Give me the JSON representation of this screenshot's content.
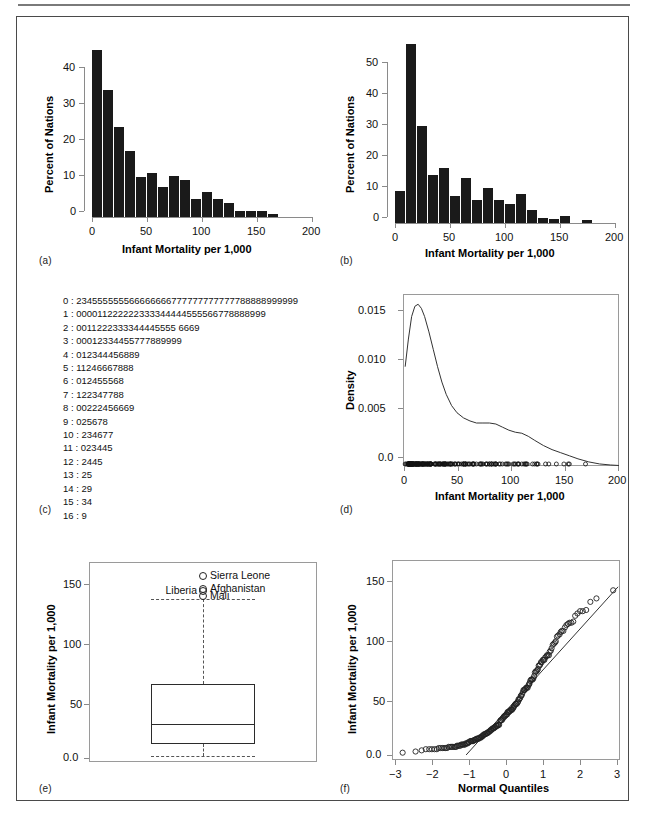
{
  "figure": {
    "panel_tags": [
      "(a)",
      "(b)",
      "(c)",
      "(d)",
      "(e)",
      "(f)"
    ]
  },
  "chart_data": [
    {
      "id": "panel-a",
      "type": "bar",
      "title": "",
      "xlabel": "Infant Mortality per 1,000",
      "ylabel": "Percent of Nations",
      "xlim": [
        0,
        200
      ],
      "ylim": [
        0,
        46
      ],
      "xticks": [
        0,
        50,
        100,
        150,
        200
      ],
      "yticks": [
        0,
        10,
        20,
        30,
        40
      ],
      "grid": false,
      "bin_width": 10,
      "bin_starts": [
        0,
        10,
        20,
        30,
        40,
        50,
        60,
        70,
        80,
        90,
        100,
        110,
        120,
        130,
        140,
        150,
        160
      ],
      "values": [
        44.6,
        33.8,
        23.9,
        17.6,
        10.7,
        11.7,
        7.9,
        10.9,
        9.8,
        4.9,
        6.8,
        4.8,
        3.7,
        1.5,
        1.5,
        1.5,
        0.7
      ]
    },
    {
      "id": "panel-b",
      "type": "bar",
      "title": "",
      "xlabel": "Infant Mortality per 1,000",
      "ylabel": "Percent of Nations",
      "xlim": [
        0,
        200
      ],
      "ylim": [
        0,
        57
      ],
      "xticks": [
        0,
        50,
        100,
        150,
        200
      ],
      "yticks": [
        0,
        10,
        20,
        30,
        40,
        50
      ],
      "grid": false,
      "bin_width": 10,
      "bin_starts": [
        0,
        10,
        20,
        30,
        40,
        50,
        60,
        70,
        80,
        90,
        100,
        110,
        120,
        130,
        140,
        150,
        160,
        170
      ],
      "values": [
        10,
        55.5,
        30,
        15,
        17,
        8.3,
        14,
        7,
        11,
        7,
        6,
        9,
        4,
        1.7,
        1.1,
        2.1,
        0,
        1
      ]
    },
    {
      "id": "panel-c",
      "type": "table",
      "title": "Stem-and-leaf display",
      "stem_separator": " : ",
      "rows": [
        {
          "stem": "0",
          "leaves": "234555555566666666777777777777788888999999"
        },
        {
          "stem": "1",
          "leaves": "000011222222333344444555566778888999"
        },
        {
          "stem": "2",
          "leaves": "0011222333344445555 6669"
        },
        {
          "stem": "3",
          "leaves": "00012334455777889999"
        },
        {
          "stem": "4",
          "leaves": "012344456889"
        },
        {
          "stem": "5",
          "leaves": "11246667888"
        },
        {
          "stem": "6",
          "leaves": "012455568"
        },
        {
          "stem": "7",
          "leaves": "122347788"
        },
        {
          "stem": "8",
          "leaves": "00222456669"
        },
        {
          "stem": "9",
          "leaves": "025678"
        },
        {
          "stem": "10",
          "leaves": "234677"
        },
        {
          "stem": "11",
          "leaves": "023445"
        },
        {
          "stem": "12",
          "leaves": "2445"
        },
        {
          "stem": "13",
          "leaves": "25"
        },
        {
          "stem": "14",
          "leaves": "29"
        },
        {
          "stem": "15",
          "leaves": "34"
        },
        {
          "stem": "16",
          "leaves": "9"
        }
      ]
    },
    {
      "id": "panel-d",
      "type": "line",
      "title": "",
      "xlabel": "Infant Mortality per 1,000",
      "ylabel": "Density",
      "xlim": [
        0,
        200
      ],
      "ylim": [
        0,
        0.0168
      ],
      "xticks": [
        0,
        50,
        100,
        150,
        200
      ],
      "yticks": [
        0.0,
        0.005,
        0.01,
        0.015
      ],
      "ytick_labels": [
        "0.0",
        "0.005",
        "0.010",
        "0.015"
      ],
      "grid": false,
      "series": [
        {
          "name": "kernel density",
          "x": [
            2,
            5,
            8,
            11,
            14,
            17,
            20,
            24,
            28,
            32,
            36,
            40,
            45,
            50,
            56,
            62,
            68,
            74,
            80,
            86,
            92,
            98,
            104,
            110,
            116,
            122,
            130,
            138,
            146,
            154,
            162,
            172,
            182,
            192,
            200
          ],
          "y": [
            0.0097,
            0.0124,
            0.0146,
            0.0156,
            0.0158,
            0.0154,
            0.0146,
            0.0131,
            0.0114,
            0.0097,
            0.0082,
            0.007,
            0.0059,
            0.0052,
            0.0047,
            0.0044,
            0.0042,
            0.0042,
            0.0042,
            0.0041,
            0.0038,
            0.0035,
            0.0033,
            0.0032,
            0.0029,
            0.0025,
            0.002,
            0.0016,
            0.0013,
            0.001,
            0.0007,
            0.0004,
            0.0002,
            0.0001,
            5e-05
          ]
        }
      ],
      "rug": {
        "description": "open-circle rug of observations along y=0",
        "values": [
          2,
          3,
          4,
          5,
          5,
          5,
          5,
          5,
          5,
          5,
          5,
          6,
          6,
          6,
          6,
          6,
          6,
          6,
          6,
          7,
          7,
          7,
          7,
          7,
          7,
          7,
          7,
          7,
          7,
          7,
          8,
          8,
          8,
          8,
          8,
          9,
          9,
          9,
          9,
          9,
          9,
          10,
          10,
          10,
          10,
          11,
          11,
          12,
          12,
          12,
          12,
          12,
          12,
          13,
          13,
          13,
          13,
          14,
          14,
          14,
          14,
          14,
          15,
          15,
          15,
          15,
          16,
          16,
          17,
          17,
          18,
          18,
          18,
          18,
          19,
          19,
          19,
          20,
          20,
          21,
          21,
          22,
          22,
          23,
          23,
          23,
          24,
          24,
          25,
          25,
          25,
          25,
          26,
          26,
          26,
          26,
          29,
          30,
          30,
          30,
          31,
          32,
          33,
          33,
          34,
          34,
          35,
          35,
          37,
          37,
          37,
          38,
          38,
          39,
          39,
          39,
          39,
          40,
          41,
          42,
          43,
          44,
          44,
          44,
          45,
          46,
          48,
          48,
          49,
          51,
          51,
          52,
          54,
          56,
          56,
          56,
          57,
          58,
          58,
          58,
          60,
          61,
          62,
          64,
          65,
          65,
          65,
          66,
          68,
          71,
          72,
          72,
          73,
          74,
          77,
          77,
          78,
          80,
          80,
          82,
          82,
          82,
          84,
          85,
          86,
          86,
          86,
          89,
          90,
          92,
          95,
          96,
          97,
          98,
          102,
          103,
          104,
          106,
          107,
          107,
          110,
          112,
          113,
          114,
          114,
          115,
          120,
          122,
          124,
          124,
          125,
          132,
          135,
          142,
          149,
          153,
          154,
          169
        ]
      }
    },
    {
      "id": "panel-e",
      "type": "box",
      "title": "",
      "xlabel": "",
      "ylabel": "Infant Mortality per 1,000",
      "ylim": [
        -5,
        165
      ],
      "yticks": [
        0.0,
        50,
        100,
        150
      ],
      "ytick_labels": [
        "0.0",
        "50",
        "100",
        "150"
      ],
      "grid": false,
      "box": {
        "lower_whisker": 2.0,
        "q1": 12.0,
        "median": 29.0,
        "q3": 64.0,
        "upper_whisker": 137.0
      },
      "outliers": [
        {
          "label": "Sierra Leone",
          "value": 157,
          "label_side": "right"
        },
        {
          "label": "Afghanistan",
          "value": 146,
          "label_side": "right"
        },
        {
          "label": "Liberia",
          "value": 144,
          "label_side": "left"
        },
        {
          "label": "Mali",
          "value": 140,
          "label_side": "right"
        }
      ]
    },
    {
      "id": "panel-f",
      "type": "scatter",
      "title": "",
      "xlabel": "Normal Quantiles",
      "ylabel": "Infant Mortality per 1,000",
      "xlim": [
        -3,
        3
      ],
      "ylim": [
        -6,
        166
      ],
      "xticks": [
        -3,
        -2,
        -1,
        0,
        1,
        2,
        3
      ],
      "xtick_labels": [
        "−3",
        "−2",
        "−1",
        "0",
        "1",
        "2",
        "3"
      ],
      "yticks": [
        0.0,
        50,
        100,
        150
      ],
      "ytick_labels": [
        "0.0",
        "50",
        "100",
        "150"
      ],
      "grid": false,
      "reference_line": {
        "x": [
          -1.05,
          2.95
        ],
        "y": [
          0,
          145
        ]
      },
      "points_x": [
        -2.72,
        -2.38,
        -2.22,
        -2.11,
        -2.02,
        -1.95,
        -1.88,
        -1.82,
        -1.77,
        -1.72,
        -1.67,
        -1.63,
        -1.59,
        -1.55,
        -1.51,
        -1.47,
        -1.44,
        -1.41,
        -1.37,
        -1.34,
        -1.31,
        -1.29,
        -1.26,
        -1.23,
        -1.2,
        -1.18,
        -1.15,
        -1.13,
        -1.1,
        -1.08,
        -1.06,
        -1.03,
        -1.01,
        -0.99,
        -0.97,
        -0.94,
        -0.92,
        -0.9,
        -0.88,
        -0.86,
        -0.84,
        -0.82,
        -0.8,
        -0.78,
        -0.76,
        -0.74,
        -0.72,
        -0.7,
        -0.68,
        -0.66,
        -0.64,
        -0.62,
        -0.61,
        -0.59,
        -0.57,
        -0.55,
        -0.53,
        -0.51,
        -0.49,
        -0.48,
        -0.46,
        -0.44,
        -0.42,
        -0.4,
        -0.39,
        -0.37,
        -0.35,
        -0.33,
        -0.32,
        -0.3,
        -0.28,
        -0.26,
        -0.25,
        -0.23,
        -0.21,
        -0.2,
        -0.18,
        -0.16,
        -0.14,
        -0.13,
        -0.11,
        -0.09,
        -0.08,
        -0.06,
        -0.04,
        -0.03,
        -0.01,
        0.01,
        0.03,
        0.04,
        0.06,
        0.08,
        0.09,
        0.11,
        0.13,
        0.14,
        0.16,
        0.18,
        0.2,
        0.21,
        0.23,
        0.25,
        0.26,
        0.28,
        0.3,
        0.32,
        0.33,
        0.35,
        0.37,
        0.39,
        0.4,
        0.42,
        0.44,
        0.46,
        0.48,
        0.49,
        0.51,
        0.53,
        0.55,
        0.57,
        0.59,
        0.61,
        0.62,
        0.64,
        0.66,
        0.68,
        0.7,
        0.72,
        0.74,
        0.76,
        0.78,
        0.8,
        0.82,
        0.84,
        0.86,
        0.88,
        0.9,
        0.92,
        0.94,
        0.97,
        0.99,
        1.01,
        1.03,
        1.06,
        1.08,
        1.1,
        1.13,
        1.15,
        1.18,
        1.2,
        1.23,
        1.26,
        1.29,
        1.31,
        1.34,
        1.37,
        1.41,
        1.44,
        1.47,
        1.51,
        1.55,
        1.59,
        1.63,
        1.67,
        1.72,
        1.77,
        1.82,
        1.88,
        1.95,
        2.02,
        2.11,
        2.22,
        2.38,
        2.82
      ],
      "points_y": [
        2,
        3,
        4,
        5,
        5,
        5,
        5,
        5,
        6,
        6,
        6,
        6,
        6,
        6,
        7,
        7,
        7,
        7,
        7,
        7,
        7,
        8,
        8,
        8,
        8,
        9,
        9,
        9,
        9,
        9,
        10,
        10,
        10,
        11,
        11,
        12,
        12,
        12,
        12,
        12,
        13,
        13,
        13,
        14,
        14,
        14,
        14,
        15,
        15,
        15,
        16,
        16,
        17,
        17,
        18,
        18,
        18,
        19,
        19,
        19,
        20,
        20,
        21,
        21,
        22,
        22,
        23,
        23,
        23,
        24,
        24,
        25,
        25,
        25,
        26,
        26,
        26,
        29,
        30,
        30,
        30,
        31,
        32,
        33,
        33,
        34,
        34,
        35,
        35,
        37,
        37,
        37,
        38,
        38,
        39,
        39,
        39,
        40,
        41,
        42,
        43,
        44,
        44,
        44,
        45,
        46,
        48,
        48,
        49,
        51,
        51,
        52,
        54,
        56,
        56,
        56,
        57,
        58,
        58,
        58,
        60,
        61,
        62,
        64,
        65,
        65,
        65,
        66,
        68,
        71,
        72,
        72,
        73,
        74,
        77,
        77,
        78,
        80,
        80,
        82,
        82,
        82,
        84,
        85,
        86,
        86,
        86,
        89,
        90,
        92,
        95,
        96,
        97,
        98,
        102,
        103,
        104,
        106,
        107,
        107,
        110,
        112,
        113,
        114,
        114,
        115,
        120,
        122,
        124,
        124,
        125,
        132,
        135,
        142,
        144,
        146,
        157
      ]
    }
  ]
}
